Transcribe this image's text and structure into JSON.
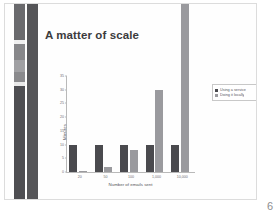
{
  "slide": {
    "title": "A matter of scale",
    "page_number": "6",
    "background_color": "#fefefe",
    "title_color": "#3b3b3d"
  },
  "decor": {
    "strip_a_name": "left-accent-strip-light",
    "strip_b_name": "left-accent-strip-dark",
    "strip_b_color": "#555558",
    "strip_a_segments": [
      {
        "top": 0,
        "height": 36,
        "color": "#6a6a6d"
      },
      {
        "top": 36,
        "height": 4,
        "color": "#f0f0f0"
      },
      {
        "top": 40,
        "height": 16,
        "color": "#87878a"
      },
      {
        "top": 56,
        "height": 12,
        "color": "#a0a0a3"
      },
      {
        "top": 68,
        "height": 10,
        "color": "#8a8a8d"
      },
      {
        "top": 78,
        "height": 4,
        "color": "#e8e8e8"
      },
      {
        "top": 82,
        "height": 115,
        "color": "#4e4e52"
      }
    ]
  },
  "legend": {
    "items": [
      {
        "label": "Using a service",
        "color": "#4a4a4e"
      },
      {
        "label": "Doing it locally",
        "color": "#9a9a9e"
      }
    ]
  },
  "chart_data": {
    "type": "bar",
    "title": "A matter of scale",
    "xlabel": "Number of emails sent",
    "ylabel": "Minutes",
    "categories": [
      "20",
      "50",
      "100",
      "1,000",
      "10,000"
    ],
    "series": [
      {
        "name": "Using a service",
        "color": "#4a4a4e",
        "values": [
          10,
          10,
          10,
          10,
          10
        ]
      },
      {
        "name": "Doing it locally",
        "color": "#9a9a9e",
        "values": [
          0.4,
          2,
          8,
          30,
          62
        ]
      }
    ],
    "ylim": [
      0,
      35
    ],
    "yticks": [
      0,
      5,
      10,
      15,
      20,
      25,
      30,
      35
    ],
    "ytick_labels": [
      "0",
      "5",
      "10",
      "15",
      "20",
      "25",
      "30",
      "35"
    ],
    "grid": false,
    "legend_position": "right"
  }
}
